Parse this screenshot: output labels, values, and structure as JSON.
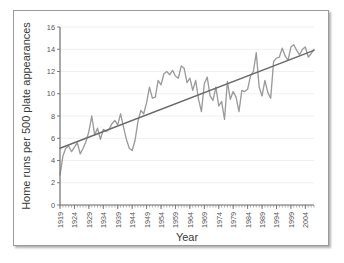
{
  "figure": {
    "background_color": "#ffffff",
    "frame_border_color": "#9a9a9a"
  },
  "chart_data": {
    "type": "line",
    "title": "",
    "xlabel": "Year",
    "ylabel": "Home runs per 500 plate appearances",
    "xlim": [
      1919,
      2007
    ],
    "ylim": [
      0,
      16
    ],
    "grid": true,
    "legend_position": "none",
    "ytick_labels": [
      "0",
      "2",
      "4",
      "6",
      "8",
      "10",
      "12",
      "14",
      "16"
    ],
    "ytick_values": [
      0,
      2,
      4,
      6,
      8,
      10,
      12,
      14,
      16
    ],
    "xtick_labels": [
      "1919",
      "1924",
      "1929",
      "1934",
      "1939",
      "1944",
      "1949",
      "1954",
      "1959",
      "1964",
      "1969",
      "1974",
      "1979",
      "1984",
      "1989",
      "1994",
      "1999",
      "2004"
    ],
    "xtick_values": [
      1919,
      1924,
      1929,
      1934,
      1939,
      1944,
      1949,
      1954,
      1959,
      1964,
      1969,
      1974,
      1979,
      1984,
      1989,
      1994,
      1999,
      2004
    ],
    "minor_xtick_step": 1,
    "series": [
      {
        "name": "Home runs per 500 plate appearances",
        "color": "#9b9b9b",
        "style": "line",
        "x": [
          1919,
          1920,
          1921,
          1922,
          1923,
          1924,
          1925,
          1926,
          1927,
          1928,
          1929,
          1930,
          1931,
          1932,
          1933,
          1934,
          1935,
          1936,
          1937,
          1938,
          1939,
          1940,
          1941,
          1942,
          1943,
          1944,
          1945,
          1946,
          1947,
          1948,
          1949,
          1950,
          1951,
          1952,
          1953,
          1954,
          1955,
          1956,
          1957,
          1958,
          1959,
          1960,
          1961,
          1962,
          1963,
          1964,
          1965,
          1966,
          1967,
          1968,
          1969,
          1970,
          1971,
          1972,
          1973,
          1974,
          1975,
          1976,
          1977,
          1978,
          1979,
          1980,
          1981,
          1982,
          1983,
          1984,
          1985,
          1986,
          1987,
          1988,
          1989,
          1990,
          1991,
          1992,
          1993,
          1994,
          1995,
          1996,
          1997,
          1998,
          1999,
          2000,
          2001,
          2002,
          2003,
          2004,
          2005,
          2006,
          2007
        ],
        "values": [
          2.7,
          4.4,
          5.1,
          5.3,
          4.8,
          5.2,
          5.6,
          4.6,
          5.1,
          5.7,
          6.6,
          8.0,
          6.3,
          6.9,
          5.9,
          6.8,
          6.6,
          6.8,
          7.3,
          7.6,
          7.2,
          8.2,
          7.0,
          5.9,
          5.1,
          4.9,
          5.8,
          7.5,
          8.5,
          8.2,
          9.2,
          10.6,
          9.6,
          9.7,
          11.2,
          10.8,
          11.8,
          12.0,
          11.7,
          12.1,
          11.6,
          11.4,
          12.5,
          12.3,
          11.0,
          11.4,
          10.3,
          11.2,
          9.5,
          8.4,
          10.9,
          11.5,
          9.8,
          9.4,
          10.6,
          8.9,
          9.3,
          7.7,
          11.1,
          9.5,
          10.2,
          9.7,
          8.4,
          10.3,
          10.2,
          10.4,
          11.6,
          12.0,
          13.7,
          10.6,
          9.8,
          11.2,
          10.1,
          9.6,
          12.9,
          13.2,
          13.3,
          14.1,
          13.4,
          13.0,
          14.2,
          14.4,
          13.9,
          13.5,
          14.0,
          14.2,
          13.3,
          13.6,
          14.0
        ]
      }
    ],
    "trend_line": {
      "name": "linear trend",
      "color": "#6a6a6a",
      "style": "line",
      "x_start": 1919,
      "y_start": 5.1,
      "x_end": 2007,
      "y_end": 13.9
    }
  }
}
